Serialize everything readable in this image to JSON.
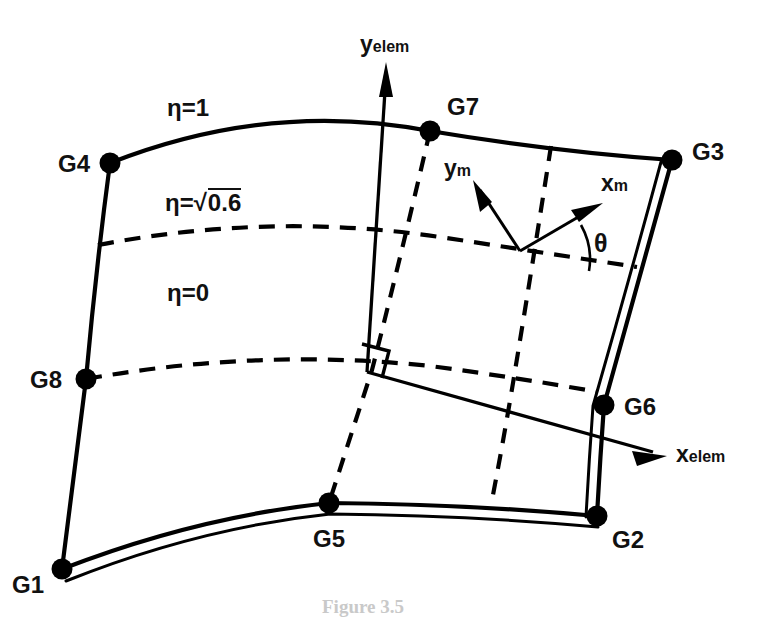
{
  "figure": {
    "kind": "engineering-diagram",
    "background_color": "#ffffff",
    "ink_color": "#000000"
  },
  "nodes": [
    {
      "id": "G1",
      "label": "G1",
      "role": "corner-node",
      "x": 62,
      "y": 569
    },
    {
      "id": "G2",
      "label": "G2",
      "role": "corner-node",
      "x": 597,
      "y": 516
    },
    {
      "id": "G3",
      "label": "G3",
      "role": "corner-node",
      "x": 672,
      "y": 160
    },
    {
      "id": "G4",
      "label": "G4",
      "role": "corner-node",
      "x": 110,
      "y": 163
    },
    {
      "id": "G5",
      "label": "G5",
      "role": "mid-side-node",
      "x": 329,
      "y": 503
    },
    {
      "id": "G6",
      "label": "G6",
      "role": "mid-side-node",
      "x": 604,
      "y": 405
    },
    {
      "id": "G7",
      "label": "G7",
      "role": "mid-side-node",
      "x": 430,
      "y": 131
    },
    {
      "id": "G8",
      "label": "G8",
      "role": "mid-side-node",
      "x": 86,
      "y": 379
    }
  ],
  "eta_labels": [
    {
      "id": "eta-1",
      "text": "η=1",
      "value": "1"
    },
    {
      "id": "eta-sqrt06",
      "prefix": "η=",
      "radical": "√",
      "radicand": "0.6",
      "text": "η=√0.6",
      "value": "sqrt(0.6)"
    },
    {
      "id": "eta-0",
      "text": "η=0",
      "value": "0"
    }
  ],
  "element_axes": {
    "y_axis": {
      "base": "y",
      "subscript": "elem",
      "text": "yelem"
    },
    "x_axis": {
      "base": "x",
      "subscript": "elem",
      "text": "xelem"
    }
  },
  "material_axes": {
    "y_axis": {
      "base": "y",
      "subscript": "m",
      "text": "ym"
    },
    "x_axis": {
      "base": "x",
      "subscript": "m",
      "text": "xm"
    },
    "angle": {
      "symbol": "θ",
      "text": "θ",
      "meaning": "material angle from element reference direction"
    }
  },
  "markers": {
    "right_angle": {
      "name": "right-angle-marker",
      "meaning": "perpendicular"
    }
  },
  "caption": {
    "text": "Figure 3.5"
  }
}
